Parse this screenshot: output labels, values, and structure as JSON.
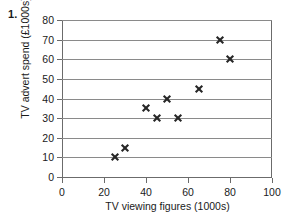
{
  "question_number": "1.",
  "chart_data": {
    "type": "scatter",
    "title": "",
    "xlabel": "TV viewing figures (1000s)",
    "ylabel": "TV advert spend (£1000s)",
    "xlim": [
      0,
      100
    ],
    "ylim": [
      0,
      80
    ],
    "xticks": [
      0,
      20,
      40,
      60,
      80,
      100
    ],
    "yticks": [
      0,
      10,
      20,
      30,
      40,
      50,
      60,
      70,
      80
    ],
    "xtick_labels": [
      "0",
      "20",
      "40",
      "60",
      "80",
      "100"
    ],
    "ytick_labels": [
      "0",
      "10",
      "20",
      "30",
      "40",
      "50",
      "60",
      "70",
      "80"
    ],
    "grid": "horizontal",
    "legend": "none",
    "marker": "x-cross",
    "marker_color": "#262626",
    "grid_color": "#8a8a8a",
    "axis_color": "#6b6b6b",
    "background": "#ffffff",
    "points": [
      {
        "x": 25,
        "y": 10
      },
      {
        "x": 30,
        "y": 15
      },
      {
        "x": 40,
        "y": 35
      },
      {
        "x": 45,
        "y": 30
      },
      {
        "x": 50,
        "y": 40
      },
      {
        "x": 55,
        "y": 30
      },
      {
        "x": 65,
        "y": 45
      },
      {
        "x": 75,
        "y": 70
      },
      {
        "x": 80,
        "y": 60
      }
    ]
  }
}
